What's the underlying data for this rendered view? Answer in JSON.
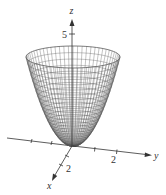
{
  "figure": {
    "surface": "elliptic paraboloid",
    "axes": {
      "z": {
        "label": "z",
        "tick_label": "5"
      },
      "y": {
        "label": "y",
        "tick_label": "2"
      },
      "x": {
        "label": "x",
        "tick_label": "2"
      }
    },
    "colors": {
      "mesh": "#555555",
      "axis": "#333333",
      "background": "#ffffff"
    }
  }
}
